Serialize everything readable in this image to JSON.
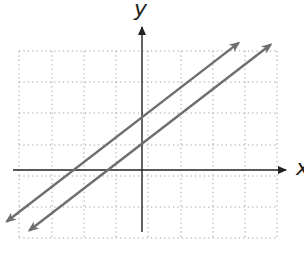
{
  "chart_data": {
    "type": "line",
    "title": "",
    "xlabel": "x",
    "ylabel": "y",
    "grid": true,
    "grid_style": "dotted",
    "xlim": [
      -4.4,
      4.2
    ],
    "ylim": [
      -2.2,
      3.8
    ],
    "x_ticks": [
      -4,
      -3,
      -2,
      -1,
      0,
      1,
      2,
      3,
      4
    ],
    "y_ticks": [
      -2,
      -1,
      0,
      1,
      2,
      3
    ],
    "tick_labels_shown": false,
    "series": [
      {
        "name": "Line 1",
        "slope": 0.8,
        "intercept": 1.7,
        "x": [
          -4.2,
          3.0
        ],
        "y": [
          -1.66,
          4.1
        ],
        "arrows": "both",
        "color": "#6e6e6e"
      },
      {
        "name": "Line 2",
        "slope": 0.8,
        "intercept": 0.85,
        "x": [
          -3.5,
          4.0
        ],
        "y": [
          -1.95,
          4.05
        ],
        "arrows": "both",
        "color": "#6e6e6e"
      }
    ],
    "annotations": []
  },
  "labels": {
    "x_axis": "x",
    "y_axis": "y"
  },
  "colors": {
    "axis": "#222222",
    "grid": "#9a9a9a",
    "line": "#6e6e6e"
  }
}
